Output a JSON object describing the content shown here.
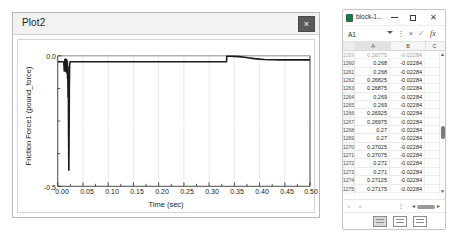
{
  "plot_window": {
    "title": "Plot2",
    "close_label": "×",
    "close_icon": "close-icon"
  },
  "chart_data": {
    "type": "line",
    "title": "",
    "xlabel": "Time (sec)",
    "ylabel": "Friction Force1 (pound_force)",
    "xlim": [
      0.0,
      0.5
    ],
    "ylim": [
      -0.5,
      0.0
    ],
    "xticks": [
      0.0,
      0.05,
      0.1,
      0.15,
      0.2,
      0.25,
      0.3,
      0.35,
      0.4,
      0.45,
      0.5
    ],
    "xticklabels": [
      "0.00",
      "0.05",
      "0.10",
      "0.15",
      "0.20",
      "0.25",
      "0.30",
      "0.35",
      "0.40",
      "0.45",
      "0.50"
    ],
    "yticks": [
      0.0,
      -0.5
    ],
    "yticklabels": [
      "0.0",
      "-0.5"
    ],
    "grid": true,
    "legend": "none",
    "line_color": "#1a1a1a",
    "series": [
      {
        "name": "Friction Force1",
        "x": [
          0.0,
          0.004,
          0.008,
          0.01,
          0.012,
          0.013,
          0.014,
          0.0145,
          0.015,
          0.0155,
          0.016,
          0.0165,
          0.017,
          0.0175,
          0.018,
          0.0185,
          0.019,
          0.0195,
          0.02,
          0.0205,
          0.021,
          0.0215,
          0.022,
          0.0225,
          0.023,
          0.0235,
          0.024,
          0.0245,
          0.025,
          0.03,
          0.04,
          0.06,
          0.1,
          0.15,
          0.2,
          0.25,
          0.3,
          0.33,
          0.3345,
          0.335,
          0.34,
          0.35,
          0.36,
          0.37,
          0.38,
          0.39,
          0.4,
          0.41,
          0.42,
          0.43,
          0.44,
          0.46,
          0.48,
          0.5
        ],
        "y": [
          -0.023,
          -0.023,
          -0.023,
          -0.023,
          -0.024,
          -0.06,
          -0.012,
          -0.055,
          -0.01,
          -0.062,
          -0.014,
          -0.058,
          -0.011,
          -0.064,
          -0.015,
          -0.07,
          -0.02,
          -0.09,
          -0.04,
          -0.16,
          -0.07,
          -0.3,
          -0.44,
          -0.3,
          -0.12,
          -0.04,
          -0.028,
          -0.024,
          -0.0228,
          -0.0228,
          -0.0228,
          -0.0228,
          -0.0228,
          -0.0228,
          -0.0228,
          -0.0228,
          -0.0228,
          -0.0228,
          -0.0228,
          -0.0018,
          -0.0018,
          -0.002,
          -0.0032,
          -0.0055,
          -0.0082,
          -0.0108,
          -0.0128,
          -0.0142,
          -0.015,
          -0.0153,
          -0.0155,
          -0.0156,
          -0.0156,
          -0.0156
        ]
      }
    ]
  },
  "excel_window": {
    "app_icon": "excel-icon",
    "title": "block-1...",
    "minimize_icon": "minimize-icon",
    "maximize_icon": "maximize-icon",
    "close_icon": "close-icon",
    "formula_bar": {
      "name_box_value": "A1",
      "name_box_caret_icon": "chevron-down-icon",
      "more_icon": "more-vertical-icon",
      "cancel_icon": "cancel-icon",
      "confirm_icon": "check-icon",
      "function_icon": "fx-icon",
      "cancel_label": "×",
      "confirm_label": "✓",
      "function_label": "fx",
      "more_label": "⋮"
    },
    "column_headers": [
      "",
      "A",
      "B",
      "C"
    ],
    "rows": [
      {
        "n": "1259",
        "a": "0.26775",
        "b": "-0.02284",
        "c": "",
        "clipped": true
      },
      {
        "n": "1260",
        "a": "0.268",
        "b": "-0.02284",
        "c": ""
      },
      {
        "n": "1261",
        "a": "0.268",
        "b": "-0.02284",
        "c": ""
      },
      {
        "n": "1262",
        "a": "0.26825",
        "b": "-0.02284",
        "c": ""
      },
      {
        "n": "1263",
        "a": "0.26875",
        "b": "-0.02284",
        "c": ""
      },
      {
        "n": "1264",
        "a": "0.269",
        "b": "-0.02284",
        "c": ""
      },
      {
        "n": "1265",
        "a": "0.269",
        "b": "-0.02284",
        "c": ""
      },
      {
        "n": "1266",
        "a": "0.26925",
        "b": "-0.02284",
        "c": ""
      },
      {
        "n": "1267",
        "a": "0.26975",
        "b": "-0.02284",
        "c": ""
      },
      {
        "n": "1268",
        "a": "0.27",
        "b": "-0.02284",
        "c": ""
      },
      {
        "n": "1269",
        "a": "0.27",
        "b": "-0.02284",
        "c": ""
      },
      {
        "n": "1270",
        "a": "0.27025",
        "b": "-0.02284",
        "c": ""
      },
      {
        "n": "1271",
        "a": "0.27075",
        "b": "-0.02284",
        "c": ""
      },
      {
        "n": "1272",
        "a": "0.271",
        "b": "-0.02284",
        "c": ""
      },
      {
        "n": "1273",
        "a": "0.271",
        "b": "-0.02284",
        "c": ""
      },
      {
        "n": "1274",
        "a": "0.27125",
        "b": "-0.02284",
        "c": ""
      },
      {
        "n": "1275",
        "a": "0.27175",
        "b": "-0.02284",
        "c": ""
      },
      {
        "n": "1276",
        "a": "0.272",
        "b": "-0.02284",
        "c": "",
        "clipped": true
      }
    ],
    "vscroll": {
      "up_icon": "scroll-up-icon",
      "down_icon": "scroll-down-icon",
      "up_label": "▲",
      "down_label": "▼"
    },
    "sheet_bar": {
      "prev_icon": "sheet-prev-icon",
      "next_icon": "sheet-next-icon",
      "prev_label": "‹",
      "next_label": "›",
      "more_label": "⋮",
      "hscroll_left_label": "◄",
      "hscroll_right_label": "►"
    },
    "status_bar": {
      "view_normal_icon": "view-normal-icon",
      "view_pagelayout_icon": "view-page-layout-icon",
      "view_pagebreak_icon": "view-page-break-icon"
    }
  }
}
